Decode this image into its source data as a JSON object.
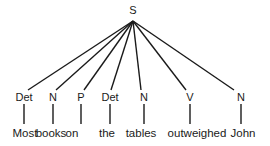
{
  "figure": {
    "type": "constituency-tree",
    "background_color": "#ffffff",
    "ink_color": "#1a1a1a",
    "width": 270,
    "height": 146
  },
  "root": {
    "label": "S",
    "x": 133,
    "y": 13,
    "apex_x": 133,
    "apex_y": 21
  },
  "leaves": [
    {
      "pos": "Det",
      "word": "Most",
      "pos_x": 24,
      "word_x": 25,
      "branch_end_x": 28
    },
    {
      "pos": "N",
      "word": "books",
      "pos_x": 53,
      "word_x": 51,
      "branch_end_x": 56
    },
    {
      "pos": "P",
      "word": "on",
      "pos_x": 81,
      "word_x": 72,
      "branch_end_x": 84
    },
    {
      "pos": "Det",
      "word": "the",
      "pos_x": 110,
      "word_x": 107,
      "branch_end_x": 111
    },
    {
      "pos": "N",
      "word": "tables",
      "pos_x": 144,
      "word_x": 141,
      "branch_end_x": 141
    },
    {
      "pos": "V",
      "word": "outweighed",
      "pos_x": 190,
      "word_x": 197,
      "branch_end_x": 186
    },
    {
      "pos": "N",
      "word": "John",
      "pos_x": 241,
      "word_x": 243,
      "branch_end_x": 234
    }
  ],
  "geometry": {
    "pos_row_y": 100,
    "word_row_y": 137,
    "branch_end_y": 90,
    "stem_top_y": 104,
    "stem_bottom_y": 124,
    "stroke_width": 1.4
  },
  "sentence": "Most books on the tables outweighed John"
}
